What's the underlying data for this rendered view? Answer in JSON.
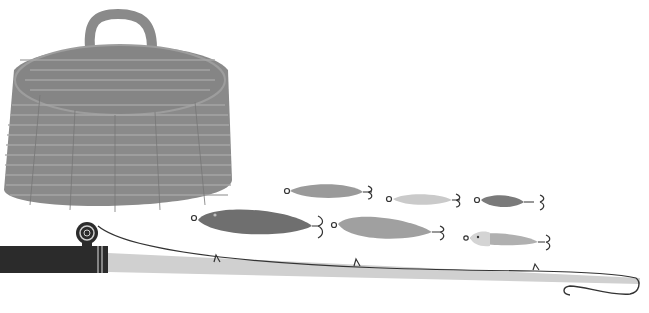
{
  "scene": {
    "description": "Illustration of fishing gear: wicker creel basket, six fishing lures with treble hooks, and a fishing rod with reel, line and hook",
    "background": "#ffffff"
  },
  "colors": {
    "basket": "#8a8a8a",
    "basket_weave_light": "#a8a8a8",
    "basket_weave_dark": "#777777",
    "lure_dark": "#6f6f6f",
    "lure_mid": "#9a9a9a",
    "lure_light": "#c9c9c9",
    "rod_shaft": "#d0d0d0",
    "rod_handle": "#2b2b2b",
    "line": "#333333"
  },
  "objects": {
    "basket": {
      "label": "Wicker creel basket"
    },
    "lures": [
      {
        "label": "Spoon lure (speckled)",
        "tone": "mid"
      },
      {
        "label": "Small light lure",
        "tone": "light"
      },
      {
        "label": "Small dark lure",
        "tone": "dark"
      },
      {
        "label": "Large fish lure",
        "tone": "dark"
      },
      {
        "label": "Medium spoon lure",
        "tone": "mid"
      },
      {
        "label": "Minnow lure",
        "tone": "light"
      }
    ],
    "rod": {
      "label": "Fishing rod with reel"
    }
  }
}
